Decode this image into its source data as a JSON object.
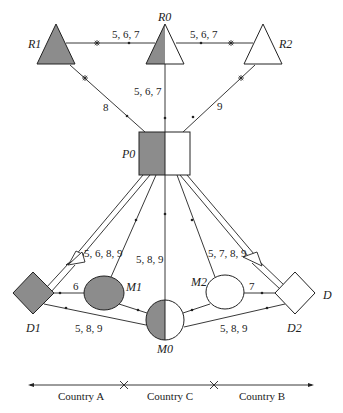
{
  "diagram": {
    "colors": {
      "fill_dark": "#8c8c8c",
      "fill_light": "#ffffff",
      "stroke": "#222222"
    },
    "nodes": {
      "R1": {
        "label": "R1",
        "shape": "triangle",
        "fill": "dark"
      },
      "R0": {
        "label": "R0",
        "shape": "triangle",
        "fill": "half"
      },
      "R2": {
        "label": "R2",
        "shape": "triangle",
        "fill": "light"
      },
      "P0": {
        "label": "P0",
        "shape": "square",
        "fill": "half"
      },
      "M1": {
        "label": "M1",
        "shape": "ellipse",
        "fill": "dark"
      },
      "M0": {
        "label": "M0",
        "shape": "ellipse",
        "fill": "half"
      },
      "M2": {
        "label": "M2",
        "shape": "ellipse",
        "fill": "light"
      },
      "D1": {
        "label": "D1",
        "shape": "diamond",
        "fill": "dark"
      },
      "D2": {
        "label": "D2",
        "shape": "diamond",
        "fill": "light"
      },
      "D": {
        "label": "D"
      }
    },
    "edges": {
      "r1_r0": "5, 6, 7",
      "r2_r0": "5, 6, 7",
      "r0_p0": "5, 6, 7",
      "r1_p0": "8",
      "r2_p0": "9",
      "p0_d1": "5, 6, 8, 9",
      "p0_d2": "5, 7, 8, 9",
      "m0_p0": "5, 8, 9",
      "m1_d1": "6",
      "m2_d2": "7",
      "m0_d1": "5, 8, 9",
      "m0_d2": "5, 8, 9"
    },
    "countries": {
      "a": "Country A",
      "c": "Country C",
      "b": "Country B"
    }
  }
}
